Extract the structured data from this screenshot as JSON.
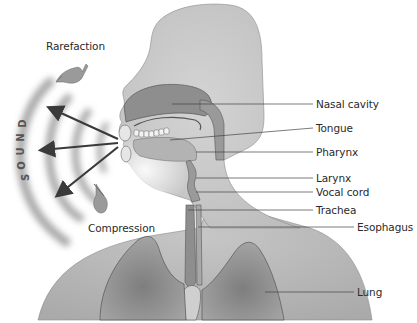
{
  "diagram": {
    "colors": {
      "background": "#ffffff",
      "body_fill": "#c8c8c8",
      "body_light": "#dedede",
      "cavity_fill": "#8e8e8e",
      "lung_fill": "#8a8a8a",
      "outline": "#555555",
      "wave": "#9a9a9a",
      "arrow": "#3a3a3a",
      "label_text": "#2a2a2a"
    },
    "annotations": {
      "rarefaction": "Rarefaction",
      "compression": "Compression",
      "sound_letters": [
        "S",
        "O",
        "U",
        "N",
        "D"
      ]
    },
    "labels": [
      {
        "id": "nasal-cavity",
        "text": "Nasal cavity"
      },
      {
        "id": "tongue",
        "text": "Tongue"
      },
      {
        "id": "pharynx",
        "text": "Pharynx"
      },
      {
        "id": "larynx",
        "text": "Larynx"
      },
      {
        "id": "vocal-cord",
        "text": "Vocal cord"
      },
      {
        "id": "trachea",
        "text": "Trachea"
      },
      {
        "id": "esophagus",
        "text": "Esophagus"
      },
      {
        "id": "lung",
        "text": "Lung"
      }
    ]
  }
}
